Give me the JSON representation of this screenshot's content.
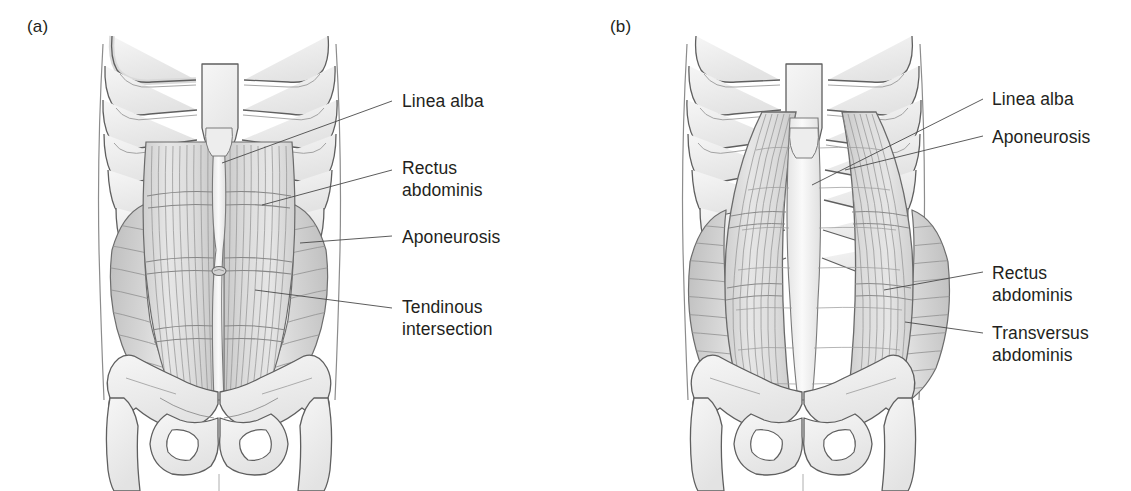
{
  "figure": {
    "background_color": "#ffffff",
    "ink_color": "#231f20",
    "line_color": "#5a5a5a",
    "fill_light": "#f2f2f2",
    "fill_mid": "#e2e2e2",
    "fill_dark": "#c9c9c9",
    "striation_color": "#9a9a9a"
  },
  "panels": [
    {
      "id": "a",
      "letter": "(a)",
      "description": "Superficial view of the anterior abdominal wall showing rectus abdominis within the rectus sheath",
      "labels": [
        {
          "id": "linea-alba",
          "text": "Linea alba",
          "lines": [
            "Linea alba"
          ]
        },
        {
          "id": "rectus-abdominis",
          "text": "Rectus abdominis",
          "lines": [
            "Rectus",
            "abdominis"
          ]
        },
        {
          "id": "aponeurosis",
          "text": "Aponeurosis",
          "lines": [
            "Aponeurosis"
          ]
        },
        {
          "id": "tendinous-intersection",
          "text": "Tendinous intersection",
          "lines": [
            "Tendinous",
            "intersection"
          ]
        }
      ]
    },
    {
      "id": "b",
      "letter": "(b)",
      "description": "Deep view of the anterior abdominal wall showing transversus abdominis beneath the reflected rectus abdominis",
      "labels": [
        {
          "id": "linea-alba",
          "text": "Linea alba",
          "lines": [
            "Linea alba"
          ]
        },
        {
          "id": "aponeurosis",
          "text": "Aponeurosis",
          "lines": [
            "Aponeurosis"
          ]
        },
        {
          "id": "rectus-abdominis",
          "text": "Rectus abdominis",
          "lines": [
            "Rectus",
            "abdominis"
          ]
        },
        {
          "id": "transversus-abdominis",
          "text": "Transversus abdominis",
          "lines": [
            "Transversus",
            "abdominis"
          ]
        }
      ]
    }
  ],
  "anatomy_parts": {
    "sternum": "sternum",
    "ribs": "costal cartilages and ribs",
    "pelvis": "pelvic girdle with iliac crest and obturator foramen",
    "femur": "proximal femur",
    "umbilicus": "umbilicus"
  }
}
